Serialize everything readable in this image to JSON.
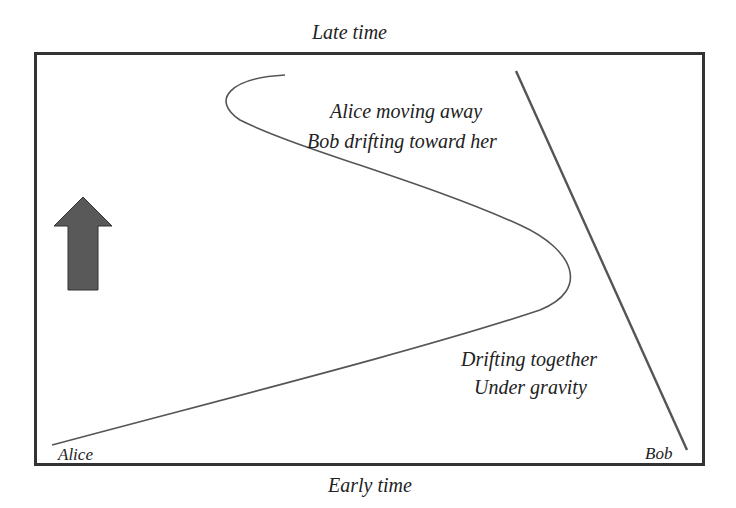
{
  "diagram": {
    "top_label": "Late time",
    "bottom_label": "Early time",
    "annotations": {
      "upper_line1": "Alice moving away",
      "upper_line2": "Bob drifting toward her",
      "lower_line1": "Drifting together",
      "lower_line2": "Under gravity"
    },
    "worldlines": {
      "alice_label": "Alice",
      "bob_label": "Bob"
    },
    "arrow": {
      "direction": "up",
      "meaning": "time"
    },
    "colors": {
      "frame": "#333333",
      "lines": "#555555",
      "arrow_fill": "#555555",
      "text": "#222222"
    }
  }
}
